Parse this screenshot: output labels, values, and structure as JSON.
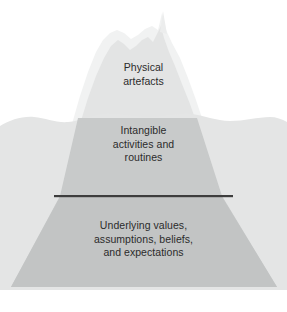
{
  "figure": {
    "name": "cultural-iceberg-model",
    "background_color": "#ffffff"
  },
  "layers": [
    {
      "id": "physical",
      "label": "Physical\nartefacts",
      "position": "above-waterline",
      "fill": "#e9eaea"
    },
    {
      "id": "intangible",
      "label": "Intangible\nactivities and\nroutines",
      "position": "upper-below-waterline",
      "fill": "#cfd1d1"
    },
    {
      "id": "underlying",
      "label": "Underlying values,\nassumptions, beliefs,\nand expectations",
      "position": "lower-below-waterline",
      "fill": "#c3c5c5"
    }
  ],
  "water": {
    "name": "water-band",
    "fill": "#e4e5e5",
    "surface_y": 117
  },
  "divider": {
    "name": "divider-line",
    "color": "#3d3d3d",
    "x_start": 54,
    "x_end": 233,
    "y": 196,
    "thickness": 2
  },
  "colors": {
    "text": "#2b2b2b",
    "peak_light": "#eff0f0",
    "peak_core": "#e1e2e2",
    "berg_underwater": "#c6c8c8",
    "water": "#e4e5e5",
    "divider": "#3d3d3d",
    "background": "#ffffff"
  }
}
